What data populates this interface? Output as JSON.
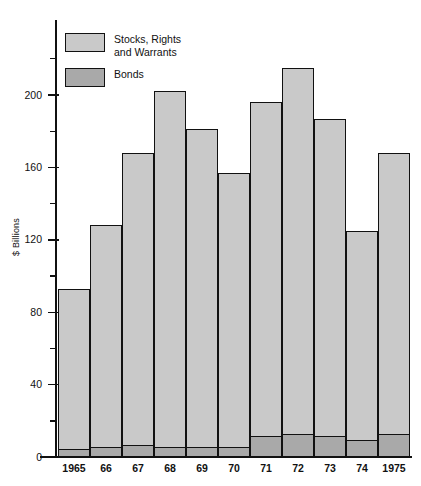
{
  "chart_data": {
    "type": "bar",
    "subtype": "stacked-vertical",
    "title": "",
    "xlabel": "",
    "ylabel": "$ Billions",
    "ylim": [
      0,
      230
    ],
    "y_major_ticks": [
      0,
      40,
      80,
      120,
      160,
      200
    ],
    "y_minor_ticks": [
      20,
      60,
      100,
      140,
      180,
      220
    ],
    "grid": false,
    "legend_position": "top-left",
    "categories": [
      "1965",
      "66",
      "67",
      "68",
      "69",
      "70",
      "71",
      "72",
      "73",
      "74",
      "1975"
    ],
    "series": [
      {
        "name": "Bonds",
        "color": "#a9a9a9",
        "values": [
          4,
          5,
          6,
          5,
          5,
          5,
          11,
          12,
          11,
          9,
          12
        ]
      },
      {
        "name": "Stocks, Rights and Warrants",
        "color": "#c9c9c9",
        "values": [
          89,
          123,
          162,
          197,
          176,
          152,
          185,
          203,
          176,
          116,
          156
        ]
      }
    ],
    "totals": [
      93,
      128,
      168,
      202,
      181,
      157,
      196,
      215,
      187,
      125,
      168
    ]
  },
  "legend": {
    "items": [
      {
        "label": "Stocks, Rights\nand Warrants",
        "swatch": "stocks-swatch"
      },
      {
        "label": "Bonds",
        "swatch": "bonds-swatch"
      }
    ]
  },
  "axis": {
    "y_title": "$ Billions",
    "y_labels": [
      "200",
      "160",
      "120",
      "80",
      "40",
      "0"
    ]
  },
  "colors": {
    "stocks": "#c9c9c9",
    "bonds": "#a9a9a9",
    "outline": "#111111",
    "background": "#ffffff"
  }
}
